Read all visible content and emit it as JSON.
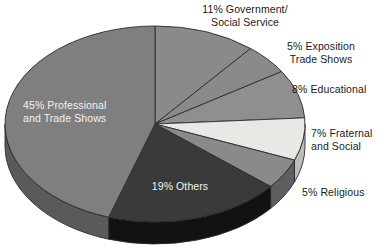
{
  "chart_data": {
    "type": "pie",
    "title": "",
    "subtitle": "",
    "xlabel": "",
    "ylabel": "",
    "legend_position": "none",
    "grid": false,
    "style": "3d-exploded-none",
    "start_angle_deg": 0,
    "direction": "clockwise",
    "categories": [
      "Government/\nSocial Service",
      "Exposition\nTrade Shows",
      "Educational",
      "Fraternal\nand Social",
      "Religious",
      "Others",
      "Professional\nand Trade Shows"
    ],
    "values": [
      11,
      5,
      8,
      7,
      5,
      19,
      45
    ],
    "units": "percent",
    "slices": [
      {
        "label": "Government/\nSocial Service",
        "label_text": "11% Government/\nSocial Service",
        "value": 11,
        "color": "#8a8a8a",
        "side_color": "#646464",
        "label_placement": "outside",
        "start_deg": 0,
        "end_deg": 39.6
      },
      {
        "label": "Exposition\nTrade Shows",
        "label_text": "5% Exposition\nTrade Shows",
        "value": 5,
        "color": "#8a8a8a",
        "side_color": "#646464",
        "label_placement": "outside",
        "start_deg": 39.6,
        "end_deg": 57.6
      },
      {
        "label": "Educational",
        "label_text": "8% Educational",
        "value": 8,
        "color": "#8f8f8f",
        "side_color": "#686868",
        "label_placement": "outside",
        "start_deg": 57.6,
        "end_deg": 86.4
      },
      {
        "label": "Fraternal\nand Social",
        "label_text": "7% Fraternal\nand Social",
        "value": 7,
        "color": "#e8e8e4",
        "side_color": "#bcbcb8",
        "label_placement": "outside",
        "start_deg": 86.4,
        "end_deg": 111.6
      },
      {
        "label": "Religious",
        "label_text": "5% Religious",
        "value": 5,
        "color": "#8a8a8a",
        "side_color": "#5e5e5e",
        "label_placement": "outside",
        "start_deg": 111.6,
        "end_deg": 129.6
      },
      {
        "label": "Others",
        "label_text": "19% Others",
        "value": 19,
        "color": "#3a3a3a",
        "side_color": "#121212",
        "label_placement": "inside",
        "start_deg": 129.6,
        "end_deg": 198.0
      },
      {
        "label": "Professional\nand Trade Shows",
        "label_text": "45% Professional\nand Trade Shows",
        "value": 45,
        "color": "#7f7f7f",
        "side_color": "#5a5a5a",
        "label_placement": "inside",
        "start_deg": 198.0,
        "end_deg": 360.0
      }
    ],
    "annotations": [
      {
        "name": "government-social-service",
        "text": "11% Government/\nSocial Service"
      },
      {
        "name": "exposition-trade-shows",
        "text": "5% Exposition\nTrade Shows"
      },
      {
        "name": "educational",
        "text": "8% Educational"
      },
      {
        "name": "fraternal-and-social",
        "text": "7% Fraternal\nand Social"
      },
      {
        "name": "religious",
        "text": "5% Religious"
      },
      {
        "name": "others",
        "text": "19% Others"
      },
      {
        "name": "professional-and-trade-shows",
        "text": "45% Professional\nand Trade Shows"
      }
    ],
    "colors": {
      "background": "#ffffff",
      "text": "#1a1a1a",
      "inner_text": "#f2f2f2",
      "outline": "#2b2b2b"
    }
  },
  "geometry": {
    "cx": 155,
    "cy": 124,
    "rx": 150,
    "ry": 98,
    "depth": 22
  }
}
